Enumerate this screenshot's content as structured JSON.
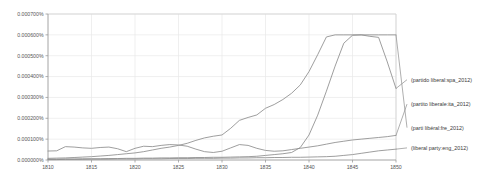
{
  "chart_data": {
    "type": "line",
    "title": "",
    "subtitle": "",
    "xlabel": "",
    "ylabel": "",
    "xlim": [
      1810,
      1850
    ],
    "ylim": [
      0.0,
      0.0007
    ],
    "grid": true,
    "legend_position": "right-inline-labels",
    "x_tick_labels": [
      "1810",
      "1815",
      "1820",
      "1825",
      "1830",
      "1835",
      "1840",
      "1845",
      "1850"
    ],
    "x_ticks": [
      1810,
      1815,
      1820,
      1825,
      1830,
      1835,
      1840,
      1845,
      1850
    ],
    "y_tick_labels": [
      "0.000000%",
      "0.000100%",
      "0.000200%",
      "0.000300%",
      "0.000400%",
      "0.000500%",
      "0.000600%",
      "0.000700%"
    ],
    "y_ticks": [
      0.0,
      0.0001,
      0.0002,
      0.0003,
      0.0004,
      0.0005,
      0.0006,
      0.0007
    ],
    "x": [
      1810,
      1811,
      1812,
      1813,
      1814,
      1815,
      1816,
      1817,
      1818,
      1819,
      1820,
      1821,
      1822,
      1823,
      1824,
      1825,
      1826,
      1827,
      1828,
      1829,
      1830,
      1831,
      1832,
      1833,
      1834,
      1835,
      1836,
      1837,
      1838,
      1839,
      1840,
      1841,
      1842,
      1843,
      1844,
      1845,
      1846,
      1847,
      1848,
      1849,
      1850
    ],
    "series": [
      {
        "name": "(partido liberal:spa_2012)",
        "color": "#8c8c8c",
        "label_y_value": 0.000385,
        "values": [
          4e-06,
          4e-06,
          5e-06,
          5e-06,
          6e-06,
          6e-06,
          6e-06,
          7e-06,
          7e-06,
          8e-06,
          8e-06,
          9e-06,
          9e-06,
          1e-05,
          1e-05,
          1.1e-05,
          1.1e-05,
          1.2e-05,
          1.2e-05,
          1.3e-05,
          1.3e-05,
          1.4e-05,
          1.5e-05,
          1.6e-05,
          1.8e-05,
          2.2e-05,
          2.6e-05,
          3e-05,
          3.6e-05,
          6e-05,
          0.00012,
          0.000215,
          0.00033,
          0.00045,
          0.00056,
          0.000598,
          0.0006,
          0.000593,
          0.000588,
          0.00047,
          0.000343
        ]
      },
      {
        "name": "(partito liberale:ita_2012)",
        "color": "#8c8c8c",
        "label_y_value": 0.000268,
        "values": [
          4.3e-05,
          4.4e-05,
          6.4e-05,
          6.2e-05,
          5.8e-05,
          5.6e-05,
          6e-05,
          6.2e-05,
          5.4e-05,
          4e-05,
          5.6e-05,
          6.6e-05,
          6.4e-05,
          7e-05,
          7.4e-05,
          7.2e-05,
          6.6e-05,
          5.2e-05,
          4e-05,
          3.6e-05,
          4.2e-05,
          5.8e-05,
          7.4e-05,
          7e-05,
          5.6e-05,
          4.6e-05,
          4.2e-05,
          4.4e-05,
          5e-05,
          5.6e-05,
          6.2e-05,
          6.8e-05,
          7.6e-05,
          8.4e-05,
          9e-05,
          9.6e-05,
          0.0001,
          0.000104,
          0.000108,
          0.000112,
          0.000118
        ]
      },
      {
        "name": "(parti libéral:fre_2012)",
        "color": "#8c8c8c",
        "label_y_value": 0.000155,
        "values": [
          8e-06,
          9e-06,
          1e-05,
          1.2e-05,
          1.4e-05,
          1.6e-05,
          1.9e-05,
          2.2e-05,
          2.6e-05,
          3e-05,
          3.4e-05,
          4e-05,
          4.8e-05,
          5.6e-05,
          6.2e-05,
          7e-05,
          8e-05,
          9.4e-05,
          0.000106,
          0.000114,
          0.00012,
          0.000152,
          0.00019,
          0.000204,
          0.000216,
          0.000248,
          0.000266,
          0.00029,
          0.00032,
          0.00036,
          0.000424,
          0.000505,
          0.00059,
          0.0006,
          0.0006,
          0.0006,
          0.0006,
          0.0006,
          0.0006,
          0.0006,
          0.0006
        ]
      },
      {
        "name": "(liberal party:eng_2012)",
        "color": "#8c8c8c",
        "label_y_value": 5.8e-05,
        "values": [
          2e-06,
          2e-06,
          3e-06,
          3e-06,
          3e-06,
          4e-06,
          4e-06,
          4e-06,
          5e-06,
          5e-06,
          5e-06,
          6e-06,
          6e-06,
          6e-06,
          7e-06,
          7e-06,
          7e-06,
          8e-06,
          8e-06,
          8e-06,
          9e-06,
          9e-06,
          1e-05,
          1e-05,
          1.1e-05,
          1.1e-05,
          1.2e-05,
          1.2e-05,
          1.3e-05,
          1.3e-05,
          1.4e-05,
          1.5e-05,
          1.6e-05,
          1.8e-05,
          2.2e-05,
          2.6e-05,
          3.2e-05,
          3.8e-05,
          4.4e-05,
          4.8e-05,
          5.2e-05
        ]
      }
    ],
    "series_labels": [
      "(partido liberal:spa_2012)",
      "(partito liberale:ita_2012)",
      "(parti libéral:fre_2012)",
      "(liberal party:eng_2012)"
    ]
  },
  "plot_geometry": {
    "left": 48,
    "right": 396,
    "top": 14,
    "bottom": 160
  }
}
